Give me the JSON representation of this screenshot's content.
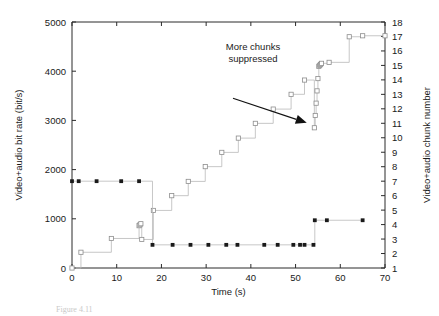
{
  "figure": {
    "caption": "Figure 4.11",
    "annotation": {
      "line1": "More chunks",
      "line2": "suppressed"
    }
  },
  "chart_data": {
    "type": "line",
    "title": "",
    "xlabel": "Time (s)",
    "ylabel": "Video+audio bit rate (bit/s)",
    "y2label": "Video+audio chunk number",
    "xlim": [
      0,
      70
    ],
    "ylim": [
      0,
      5000
    ],
    "y2lim": [
      1,
      18
    ],
    "xticks": [
      0,
      10,
      20,
      30,
      40,
      50,
      60,
      70
    ],
    "yticks": [
      0,
      1000,
      2000,
      3000,
      4000,
      5000
    ],
    "y2ticks": [
      1,
      2,
      3,
      4,
      5,
      6,
      7,
      8,
      9,
      10,
      11,
      12,
      13,
      14,
      15,
      16,
      17,
      18
    ],
    "grid": false,
    "legend": "none",
    "colors": {
      "line": "#b9b9b9",
      "open_marker_edge": "#8d8d8d",
      "filled_marker": "#1a1a1a",
      "axis": "#2b2b2b"
    },
    "series": [
      {
        "name": "Video+audio bit rate (bit/s)",
        "marker": "open-circle",
        "axis": "left",
        "step": "post",
        "x": [
          0,
          2.0,
          8.8,
          15.0,
          15.2,
          15.4,
          15.6,
          18.2,
          22.3,
          26.0,
          29.8,
          33.5,
          37.2,
          41.0,
          45.0,
          49.0,
          52.0,
          54.2,
          54.4,
          54.6,
          54.8,
          55.0,
          55.2,
          55.4,
          55.6,
          55.8,
          57.5,
          62.0,
          65.0,
          70.0
        ],
        "y": [
          0,
          320,
          600,
          860,
          880,
          900,
          580,
          1170,
          1470,
          1760,
          2060,
          2350,
          2640,
          2940,
          3230,
          3530,
          3820,
          2850,
          3100,
          3350,
          3600,
          3850,
          4100,
          4120,
          4140,
          4160,
          4180,
          4700,
          4720,
          4720
        ]
      },
      {
        "name": "Video+audio chunk number",
        "marker": "filled-square",
        "axis": "right",
        "step": "post",
        "x": [
          0,
          1.5,
          5.5,
          11.0,
          15.0,
          18.0,
          22.5,
          26.5,
          30.5,
          34.5,
          37.0,
          43.0,
          46.0,
          49.5,
          51.0,
          52.0,
          54.0,
          54.3,
          57.0,
          65.0
        ],
        "y": [
          7.0,
          7.0,
          7.0,
          7.0,
          7.0,
          2.6,
          2.6,
          2.6,
          2.6,
          2.6,
          2.6,
          2.6,
          2.6,
          2.6,
          2.6,
          2.6,
          2.6,
          4.3,
          4.3,
          4.3
        ]
      }
    ],
    "annotations": [
      {
        "text": "More chunks suppressed",
        "arrow_from": [
          36.0,
          3450
        ],
        "arrow_to": [
          52.5,
          2950
        ]
      }
    ]
  }
}
